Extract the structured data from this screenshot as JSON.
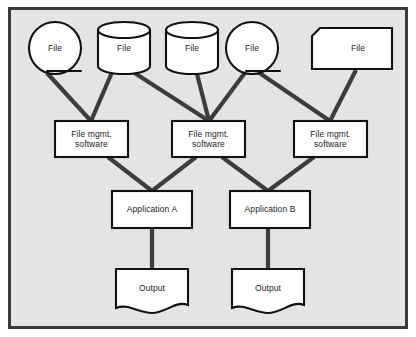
{
  "diagram": {
    "background_color": "#e4e4e4",
    "border_color": "#3a3a3a",
    "shape_fill": "#ffffff",
    "shape_stroke": "#111111",
    "connector_color": "#3d3d3d"
  },
  "files": [
    {
      "label": "File",
      "shape": "magnetic-drum",
      "x": 55,
      "y": 48
    },
    {
      "label": "File",
      "shape": "disk-cylinder",
      "x": 124,
      "y": 48
    },
    {
      "label": "File",
      "shape": "disk-cylinder",
      "x": 192,
      "y": 48
    },
    {
      "label": "File",
      "shape": "magnetic-drum",
      "x": 252,
      "y": 48
    },
    {
      "label": "File",
      "shape": "punched-card",
      "x": 350,
      "y": 48
    }
  ],
  "file_mgmt": [
    {
      "label": "File mgmt.\nsoftware",
      "x": 91,
      "y": 139
    },
    {
      "label": "File mgmt.\nsoftware",
      "x": 209,
      "y": 139
    },
    {
      "label": "File mgmt.\nsoftware",
      "x": 330,
      "y": 139
    }
  ],
  "applications": [
    {
      "label": "Application A",
      "x": 152,
      "y": 209
    },
    {
      "label": "Application B",
      "x": 268,
      "y": 209
    }
  ],
  "outputs": [
    {
      "label": "Output",
      "x": 152,
      "y": 287
    },
    {
      "label": "Output",
      "x": 268,
      "y": 287
    }
  ],
  "connectors": [
    {
      "from": "file-1",
      "to": "file-mgmt-1"
    },
    {
      "from": "file-2",
      "to": "file-mgmt-1"
    },
    {
      "from": "file-2",
      "to": "file-mgmt-2"
    },
    {
      "from": "file-3",
      "to": "file-mgmt-2"
    },
    {
      "from": "file-4",
      "to": "file-mgmt-2"
    },
    {
      "from": "file-4",
      "to": "file-mgmt-3"
    },
    {
      "from": "file-5",
      "to": "file-mgmt-3"
    },
    {
      "from": "file-mgmt-1",
      "to": "application-a"
    },
    {
      "from": "file-mgmt-2",
      "to": "application-a"
    },
    {
      "from": "file-mgmt-2",
      "to": "application-b"
    },
    {
      "from": "file-mgmt-3",
      "to": "application-b"
    },
    {
      "from": "application-a",
      "to": "output-1"
    },
    {
      "from": "application-b",
      "to": "output-2"
    }
  ]
}
